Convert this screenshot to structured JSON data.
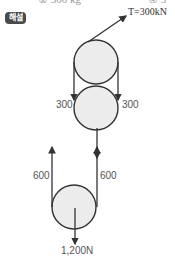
{
  "header": {
    "cut_text_left": "① 300 kg",
    "cut_text_right": "④ 3"
  },
  "badge": {
    "label": "해설"
  },
  "diagram": {
    "tension_label": "T=300kN",
    "labels": {
      "upper_left": "300",
      "upper_right": "300",
      "lower_left": "600",
      "lower_right": "600",
      "load": "1,200N"
    },
    "colors": {
      "line": "#333333",
      "fill": "#ececec"
    }
  }
}
